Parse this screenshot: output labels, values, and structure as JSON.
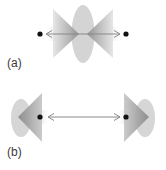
{
  "panels": [
    {
      "label": "(a)",
      "description": "Two points with cones pointing toward each other and a central ellipse between them; double-headed arrow connecting points"
    },
    {
      "label": "(b)",
      "description": "Two points with cones pointing away from each other and ellipses at outer ends; double-headed arrow connecting points"
    }
  ],
  "colors": {
    "ellipse": "#d4d4d4",
    "cone_dark": "#8c8c8c",
    "cone_light": "#e6e6e6",
    "dot": "#111111",
    "arrow": "#8a8a8a",
    "label": "#3a3a3a"
  }
}
